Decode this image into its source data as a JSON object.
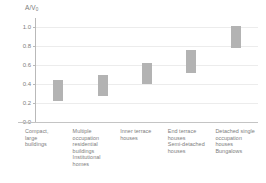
{
  "chart_data": {
    "type": "bar",
    "subtype": "floating-range-bar",
    "title": "",
    "xlabel": "",
    "ylabel": "A/V0",
    "ylabel_display": "A/V",
    "ylabel_subscript": "0",
    "ylim": [
      0.0,
      1.1
    ],
    "yticks": [
      0.0,
      0.2,
      0.4,
      0.6,
      0.8,
      1.0
    ],
    "ytick_labels": [
      "0.0",
      "0.2",
      "0.4",
      "0.6",
      "0.8",
      "1.0"
    ],
    "grid": true,
    "grid_axis": "y",
    "legend": false,
    "bar_color": "#b3b3b3",
    "categories": [
      "Compact, large buildings",
      "Multiple occupation residential buildings Institutional homes",
      "Inner terrace houses",
      "End terrace houses Semi-detached houses",
      "Detached single occupation houses Bungalows"
    ],
    "category_lines": [
      [
        "Compact,",
        "large",
        "buildings"
      ],
      [
        "Multiple",
        "occupation",
        "residential",
        "buildings",
        "Institutional",
        "homes"
      ],
      [
        "Inner terrace",
        "houses"
      ],
      [
        "End terrace",
        "houses",
        "Semi-detached",
        "houses"
      ],
      [
        "Detached single",
        "occupation",
        "houses",
        "Bungalows"
      ]
    ],
    "ranges": [
      {
        "category": "Compact, large buildings",
        "low": 0.22,
        "high": 0.44
      },
      {
        "category": "Multiple occupation residential buildings Institutional homes",
        "low": 0.28,
        "high": 0.5
      },
      {
        "category": "Inner terrace houses",
        "low": 0.4,
        "high": 0.62
      },
      {
        "category": "End terrace houses Semi-detached houses",
        "low": 0.52,
        "high": 0.76
      },
      {
        "category": "Detached single occupation houses Bungalows",
        "low": 0.78,
        "high": 1.02
      }
    ]
  }
}
